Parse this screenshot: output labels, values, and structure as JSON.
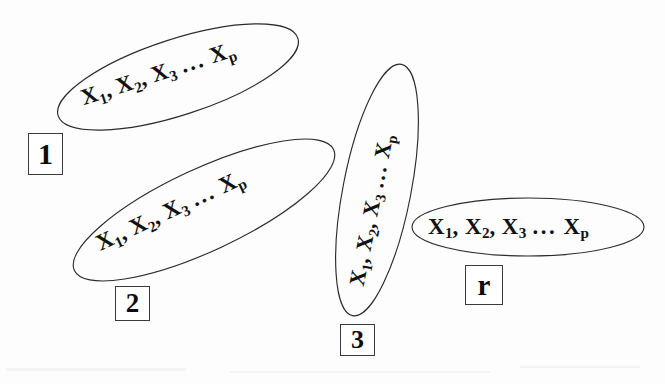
{
  "figure": {
    "background_color": "#fdfdfd",
    "ink_color": "#111111",
    "outline_color": "#2b2b2b",
    "width": 665,
    "height": 384
  },
  "variable_tokens": {
    "x": "X",
    "sub1": "1",
    "sub2": "2",
    "sub3": "3",
    "subp": "p",
    "comma": ",",
    "ellipsis": "..."
  },
  "groups": [
    {
      "id": "group-1",
      "label": "1",
      "contents": "X1, X2, X3 ... Xp",
      "ellipse": {
        "cx": 178,
        "cy": 77,
        "rx": 126,
        "ry": 38,
        "rotation": -18
      },
      "text": {
        "x": 82,
        "y": 100,
        "rotation": -18,
        "font_size": 23
      },
      "label_box": {
        "x": 28,
        "y": 133,
        "width": 35,
        "height": 42,
        "font_size": 30
      }
    },
    {
      "id": "group-2",
      "label": "2",
      "contents": "X1, X2, X3 ... Xp",
      "ellipse": {
        "cx": 204,
        "cy": 210,
        "rx": 143,
        "ry": 41,
        "rotation": -25
      },
      "text": {
        "x": 98,
        "y": 246,
        "rotation": -25,
        "font_size": 23
      },
      "label_box": {
        "x": 115,
        "y": 286,
        "width": 35,
        "height": 35,
        "font_size": 27
      }
    },
    {
      "id": "group-3",
      "label": "3",
      "contents": "X1, X2, X3 ... Xp",
      "ellipse": {
        "cx": 377,
        "cy": 190,
        "rx": 128,
        "ry": 34,
        "rotation": -79
      },
      "text": {
        "x": 358,
        "y": 286,
        "rotation": -79,
        "font_size": 22
      },
      "label_box": {
        "x": 340,
        "y": 324,
        "width": 35,
        "height": 32,
        "font_size": 26
      }
    },
    {
      "id": "group-r",
      "label": "r",
      "contents": "X1, X2, X3 ... Xp",
      "ellipse": {
        "cx": 528,
        "cy": 227,
        "rx": 116,
        "ry": 29,
        "rotation": 0
      },
      "text": {
        "x": 428,
        "y": 228,
        "rotation": 0,
        "font_size": 23
      },
      "label_box": {
        "x": 465,
        "y": 265,
        "width": 38,
        "height": 40,
        "font_size": 29
      }
    }
  ]
}
